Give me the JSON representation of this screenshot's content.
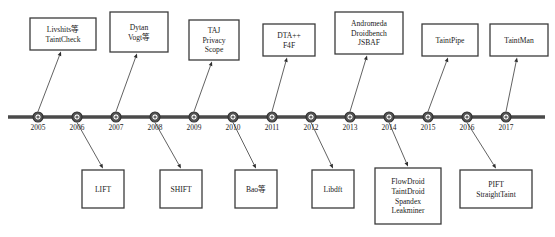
{
  "diagram": {
    "type": "timeline",
    "orientation": "horizontal",
    "axis": {
      "start_x": 8,
      "end_x": 545,
      "y": 117,
      "first_tick_x": 38,
      "tick_spacing": 39
    },
    "years": [
      "2005",
      "2006",
      "2007",
      "2008",
      "2009",
      "2010",
      "2011",
      "2012",
      "2013",
      "2014",
      "2015",
      "2016",
      "2017"
    ],
    "colors": {
      "axis": "#4a4a4a",
      "box_border": "#3b3b3b",
      "text": "#1a1a1a",
      "background": "#ffffff",
      "node_fill": "#5a5a5a"
    },
    "events_above": [
      {
        "year": "2005",
        "lines": [
          "Livshits等",
          "TaintCheck"
        ],
        "box_x": 30,
        "box_y": 18,
        "box_w": 66,
        "box_h": 32
      },
      {
        "year": "2007",
        "lines": [
          "Dytan",
          "Vogt等"
        ],
        "box_x": 110,
        "box_y": 12,
        "box_w": 58,
        "box_h": 40
      },
      {
        "year": "2009",
        "lines": [
          "TAJ",
          "Privacy",
          "Scope"
        ],
        "box_x": 189,
        "box_y": 20,
        "box_w": 50,
        "box_h": 40
      },
      {
        "year": "2011",
        "lines": [
          "DTA++",
          "F4F"
        ],
        "box_x": 263,
        "box_y": 24,
        "box_w": 52,
        "box_h": 32
      },
      {
        "year": "2013",
        "lines": [
          "Andromeda",
          "Droidbench",
          "JSBAF"
        ],
        "box_x": 335,
        "box_y": 12,
        "box_w": 68,
        "box_h": 42
      },
      {
        "year": "2015",
        "lines": [
          "TaintPipe"
        ],
        "box_x": 422,
        "box_y": 24,
        "box_w": 56,
        "box_h": 32
      },
      {
        "year": "2017",
        "lines": [
          "TaintMan"
        ],
        "box_x": 490,
        "box_y": 24,
        "box_w": 58,
        "box_h": 32
      }
    ],
    "events_below": [
      {
        "year": "2006",
        "lines": [
          "LIFT"
        ],
        "box_x": 82,
        "box_y": 170,
        "box_w": 42,
        "box_h": 38
      },
      {
        "year": "2008",
        "lines": [
          "SHIFT"
        ],
        "box_x": 160,
        "box_y": 170,
        "box_w": 42,
        "box_h": 38
      },
      {
        "year": "2010",
        "lines": [
          "Bao等"
        ],
        "box_x": 235,
        "box_y": 170,
        "box_w": 42,
        "box_h": 38
      },
      {
        "year": "2012",
        "lines": [
          "Libdft"
        ],
        "box_x": 312,
        "box_y": 170,
        "box_w": 42,
        "box_h": 38
      },
      {
        "year": "2014",
        "lines": [
          "FlowDroid",
          "TaintDroid",
          "Spandex",
          "Leakminer"
        ],
        "box_x": 375,
        "box_y": 168,
        "box_w": 66,
        "box_h": 56
      },
      {
        "year": "2016",
        "lines": [
          "PIFT",
          "StraightTaint"
        ],
        "box_x": 460,
        "box_y": 170,
        "box_w": 72,
        "box_h": 38
      }
    ]
  }
}
